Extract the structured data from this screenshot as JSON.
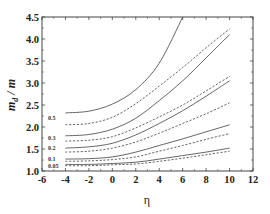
{
  "chart_data": {
    "type": "line",
    "title": "",
    "xlabel": "η",
    "ylabel": "m_d / m",
    "xlim": [
      -6,
      12
    ],
    "ylim": [
      1.0,
      4.5
    ],
    "xticks": [
      -6,
      -4,
      -2,
      0,
      2,
      4,
      6,
      8,
      10,
      12
    ],
    "yticks": [
      1.0,
      1.5,
      2.0,
      2.5,
      3.0,
      3.5,
      4.0,
      4.5
    ],
    "xtick_labels": [
      "-6",
      "-4",
      "-2",
      "0",
      "2",
      "4",
      "6",
      "8",
      "10",
      "12"
    ],
    "ytick_labels": [
      "1.0",
      "1.5",
      "2.0",
      "2.5",
      "3.0",
      "3.5",
      "4.0",
      "4.5"
    ],
    "grid": false,
    "legend": "inline curve labels at left",
    "curve_labels": [
      "0.5",
      "0.3",
      "0.2",
      "0.1",
      "0.05"
    ],
    "x": [
      -4,
      -2,
      0,
      2,
      4,
      6,
      8,
      10
    ],
    "series": [
      {
        "name": "0.5 solid",
        "style": "solid",
        "values": [
          2.32,
          2.36,
          2.52,
          2.85,
          3.45,
          4.5,
          null,
          null
        ]
      },
      {
        "name": "0.5 dashed",
        "style": "dashed",
        "values": [
          2.05,
          2.08,
          2.22,
          2.53,
          2.93,
          3.35,
          3.8,
          4.23
        ]
      },
      {
        "name": "0.3 solid",
        "style": "solid",
        "values": [
          1.8,
          1.83,
          1.95,
          2.2,
          2.6,
          3.05,
          3.57,
          4.1
        ]
      },
      {
        "name": "0.3 dashed",
        "style": "dashed",
        "values": [
          1.68,
          1.7,
          1.78,
          1.98,
          2.23,
          2.5,
          2.82,
          3.15
        ]
      },
      {
        "name": "0.2 solid",
        "style": "solid",
        "values": [
          1.52,
          1.55,
          1.63,
          1.82,
          2.08,
          2.37,
          2.7,
          3.05
        ]
      },
      {
        "name": "0.2 dashed",
        "style": "dashed",
        "values": [
          1.43,
          1.45,
          1.52,
          1.66,
          1.86,
          2.08,
          2.3,
          2.55
        ]
      },
      {
        "name": "0.1 solid",
        "style": "solid",
        "values": [
          1.27,
          1.28,
          1.32,
          1.43,
          1.58,
          1.73,
          1.89,
          2.05
        ]
      },
      {
        "name": "0.1 dashed",
        "style": "dashed",
        "values": [
          1.22,
          1.23,
          1.26,
          1.32,
          1.45,
          1.58,
          1.72,
          1.85
        ]
      },
      {
        "name": "0.05 solid",
        "style": "solid",
        "values": [
          1.15,
          1.15,
          1.17,
          1.2,
          1.27,
          1.35,
          1.43,
          1.52
        ]
      },
      {
        "name": "0.05 dashed",
        "style": "dashed",
        "values": [
          1.12,
          1.12,
          1.14,
          1.16,
          1.22,
          1.29,
          1.37,
          1.45
        ]
      }
    ]
  }
}
